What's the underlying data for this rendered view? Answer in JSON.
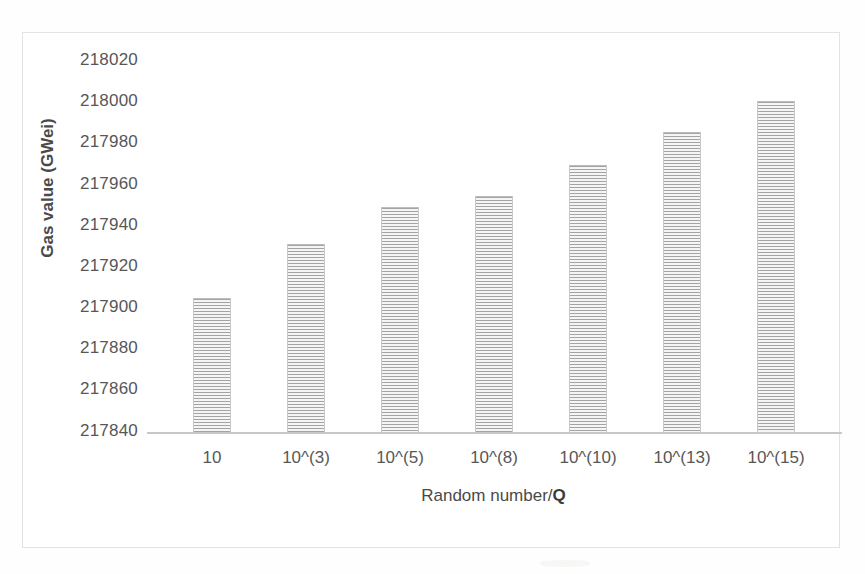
{
  "chart_data": {
    "type": "bar",
    "title": "",
    "xlabel": "Random number/Q",
    "ylabel": "Gas value (GWei)",
    "categories": [
      "10",
      "10^(3)",
      "10^(5)",
      "10^(8)",
      "10^(10)",
      "10^(13)",
      "10^(15)"
    ],
    "values": [
      217905,
      217931,
      217949,
      217954,
      217969,
      217985,
      218000
    ],
    "ylim": [
      217840,
      218020
    ],
    "ytick_labels": [
      "218020",
      "218000",
      "217980",
      "217960",
      "217940",
      "217920",
      "217900",
      "217880",
      "217860",
      "217840"
    ],
    "ytick_values": [
      218020,
      218000,
      217980,
      217960,
      217940,
      217920,
      217900,
      217880,
      217860,
      217840
    ],
    "ytick_step": 20,
    "grid": false,
    "legend": false,
    "series": [
      {
        "name": "Gas value",
        "values": [
          217905,
          217931,
          217949,
          217954,
          217969,
          217985,
          218000
        ]
      }
    ],
    "bar_color": "#d9d9d9",
    "bar_pattern": "horizontal-stripes",
    "axis_color": "#c8c8c8",
    "text_color": "#575757"
  },
  "axes": {
    "y_title": "Gas value (GWei)",
    "x_title_main": "Random number/",
    "x_title_emphasis": "Q"
  }
}
